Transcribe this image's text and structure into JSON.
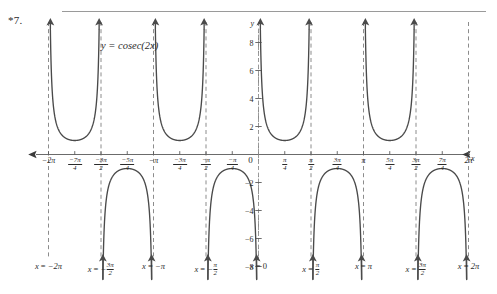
{
  "problem": {
    "number": "*7."
  },
  "chart_data": {
    "type": "line",
    "title": "",
    "curve_label": "y = cosec(2x)",
    "function": "y = cosec(2x)",
    "xlabel": "x",
    "ylabel": "y",
    "xlim": [
      -6.2832,
      6.2832
    ],
    "ylim": [
      -8.6,
      8.6
    ],
    "grid": false,
    "legend": "none",
    "x_tick_labels": [
      {
        "value": -6.2832,
        "text": "−2π",
        "kind": "plain"
      },
      {
        "value": -5.4978,
        "num": "−7π",
        "den": "4",
        "kind": "fraction"
      },
      {
        "value": -4.7124,
        "num": "−3π",
        "den": "2",
        "kind": "fraction"
      },
      {
        "value": -3.927,
        "num": "−5π",
        "den": "4",
        "kind": "fraction"
      },
      {
        "value": -3.1416,
        "text": "−π",
        "kind": "plain"
      },
      {
        "value": -2.3562,
        "num": "−3π",
        "den": "4",
        "kind": "fraction"
      },
      {
        "value": -1.5708,
        "num": "−π",
        "den": "2",
        "kind": "fraction"
      },
      {
        "value": -0.7854,
        "num": "−π",
        "den": "4",
        "kind": "fraction"
      },
      {
        "value": 0,
        "text": "0",
        "kind": "origin"
      },
      {
        "value": 0.7854,
        "num": "π",
        "den": "4",
        "kind": "fraction"
      },
      {
        "value": 1.5708,
        "num": "π",
        "den": "2",
        "kind": "fraction"
      },
      {
        "value": 2.3562,
        "num": "3π",
        "den": "4",
        "kind": "fraction"
      },
      {
        "value": 3.1416,
        "text": "π",
        "kind": "plain"
      },
      {
        "value": 3.927,
        "num": "5π",
        "den": "4",
        "kind": "fraction"
      },
      {
        "value": 4.7124,
        "num": "3π",
        "den": "2",
        "kind": "fraction"
      },
      {
        "value": 5.4978,
        "num": "7π",
        "den": "4",
        "kind": "fraction"
      },
      {
        "value": 6.2832,
        "text": "2π",
        "kind": "plain"
      }
    ],
    "y_tick_labels": [
      {
        "value": 8,
        "text": "8"
      },
      {
        "value": 6,
        "text": "6"
      },
      {
        "value": 4,
        "text": "4"
      },
      {
        "value": 2,
        "text": "2"
      },
      {
        "value": -2,
        "text": "−2"
      },
      {
        "value": -4,
        "text": "−4"
      },
      {
        "value": -6,
        "text": "−6"
      },
      {
        "value": -8,
        "text": "−8"
      }
    ],
    "asymptotes": [
      {
        "x": -6.2832,
        "label_parts": [
          {
            "t": "x",
            "i": true
          },
          {
            "t": " = ",
            "i": false
          },
          {
            "t": "−2π",
            "i": true
          }
        ]
      },
      {
        "x": -4.7124,
        "label_parts": [
          {
            "t": "x",
            "i": true
          },
          {
            "t": " = ",
            "i": false
          },
          {
            "t": "−",
            "i": true
          },
          {
            "t": "frac:3π|2",
            "i": true
          }
        ]
      },
      {
        "x": -3.1416,
        "label_parts": [
          {
            "t": "x",
            "i": true
          },
          {
            "t": " = ",
            "i": false
          },
          {
            "t": "−π",
            "i": true
          }
        ]
      },
      {
        "x": -1.5708,
        "label_parts": [
          {
            "t": "x",
            "i": true
          },
          {
            "t": " = ",
            "i": false
          },
          {
            "t": "−",
            "i": true
          },
          {
            "t": "frac:π|2",
            "i": true
          }
        ]
      },
      {
        "x": 0,
        "label_parts": [
          {
            "t": "x",
            "i": true
          },
          {
            "t": " = ",
            "i": false
          },
          {
            "t": "0",
            "i": false
          }
        ]
      },
      {
        "x": 1.5708,
        "label_parts": [
          {
            "t": "x",
            "i": true
          },
          {
            "t": " = ",
            "i": false
          },
          {
            "t": "frac:π|2",
            "i": true
          }
        ]
      },
      {
        "x": 3.1416,
        "label_parts": [
          {
            "t": "x",
            "i": true
          },
          {
            "t": " = ",
            "i": false
          },
          {
            "t": "π",
            "i": true
          }
        ]
      },
      {
        "x": 4.7124,
        "label_parts": [
          {
            "t": "x",
            "i": true
          },
          {
            "t": " = ",
            "i": false
          },
          {
            "t": "frac:3π|2",
            "i": true
          }
        ]
      },
      {
        "x": 6.2832,
        "label_parts": [
          {
            "t": "x",
            "i": true
          },
          {
            "t": " = ",
            "i": false
          },
          {
            "t": "2π",
            "i": true
          }
        ]
      }
    ],
    "asymptote_caption_texts": [
      "x = −2π",
      "x = −3π/2",
      "x = −π",
      "x = −π/2",
      "x = 0",
      "x = π/2",
      "x = π",
      "x = 3π/2",
      "x = 2π"
    ],
    "branches": [
      {
        "interval": [
          -6.2832,
          -4.7124
        ],
        "sign": "positive",
        "minimum": {
          "x": -5.4978,
          "y": 1
        }
      },
      {
        "interval": [
          -4.7124,
          -3.1416
        ],
        "sign": "negative",
        "maximum": {
          "x": -3.927,
          "y": -1
        }
      },
      {
        "interval": [
          -3.1416,
          -1.5708
        ],
        "sign": "positive",
        "minimum": {
          "x": -2.3562,
          "y": 1
        }
      },
      {
        "interval": [
          -1.5708,
          0
        ],
        "sign": "negative",
        "maximum": {
          "x": -0.7854,
          "y": -1
        }
      },
      {
        "interval": [
          0,
          1.5708
        ],
        "sign": "positive",
        "minimum": {
          "x": 0.7854,
          "y": 1
        }
      },
      {
        "interval": [
          1.5708,
          3.1416
        ],
        "sign": "negative",
        "maximum": {
          "x": 2.3562,
          "y": -1
        }
      },
      {
        "interval": [
          3.1416,
          4.7124
        ],
        "sign": "positive",
        "minimum": {
          "x": 3.927,
          "y": 1
        }
      },
      {
        "interval": [
          4.7124,
          6.2832
        ],
        "sign": "negative",
        "maximum": {
          "x": 5.4978,
          "y": -1
        }
      }
    ],
    "colors": {
      "curve": "#4a4a4a",
      "axis": "#6b6b6b",
      "asymptote": "#8c8c8c",
      "text": "#2b2b2b",
      "rule": "#9a9a9a",
      "background": "#ffffff"
    }
  }
}
